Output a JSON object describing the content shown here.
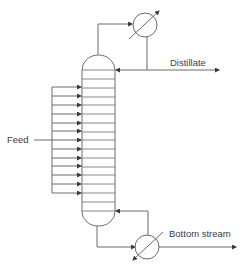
{
  "diagram": {
    "type": "distillation-column-process-flow",
    "labels": {
      "feed": "Feed",
      "distillate": "Distillate",
      "bottom": "Bottom stream"
    },
    "column": {
      "tray_count": 16,
      "feed_inlets": 13
    },
    "equipment": [
      {
        "name": "condenser",
        "symbol": "heat-exchanger"
      },
      {
        "name": "reboiler",
        "symbol": "heat-exchanger"
      }
    ],
    "colors": {
      "line": "#6b6b6b",
      "text": "#3c3c3c",
      "background": "#ffffff"
    }
  }
}
